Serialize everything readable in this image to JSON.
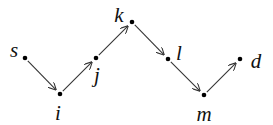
{
  "diagram": {
    "type": "directed-path",
    "nodes": [
      {
        "id": "s",
        "label": "s",
        "x": 25,
        "y": 58,
        "lx": 14,
        "ly": 57
      },
      {
        "id": "i",
        "label": "i",
        "x": 60,
        "y": 94,
        "lx": 58,
        "ly": 120
      },
      {
        "id": "j",
        "label": "j",
        "x": 96,
        "y": 58,
        "lx": 97,
        "ly": 82
      },
      {
        "id": "k",
        "label": "k",
        "x": 132,
        "y": 22,
        "lx": 119,
        "ly": 22
      },
      {
        "id": "l",
        "label": "l",
        "x": 168,
        "y": 59,
        "lx": 179,
        "ly": 60
      },
      {
        "id": "m",
        "label": "m",
        "x": 204,
        "y": 95,
        "lx": 204,
        "ly": 121
      },
      {
        "id": "d",
        "label": "d",
        "x": 240,
        "y": 59,
        "lx": 256,
        "ly": 68
      }
    ],
    "edges": [
      {
        "from": "s",
        "to": "i"
      },
      {
        "from": "i",
        "to": "j"
      },
      {
        "from": "j",
        "to": "k"
      },
      {
        "from": "k",
        "to": "l"
      },
      {
        "from": "l",
        "to": "m"
      },
      {
        "from": "m",
        "to": "d"
      }
    ]
  }
}
